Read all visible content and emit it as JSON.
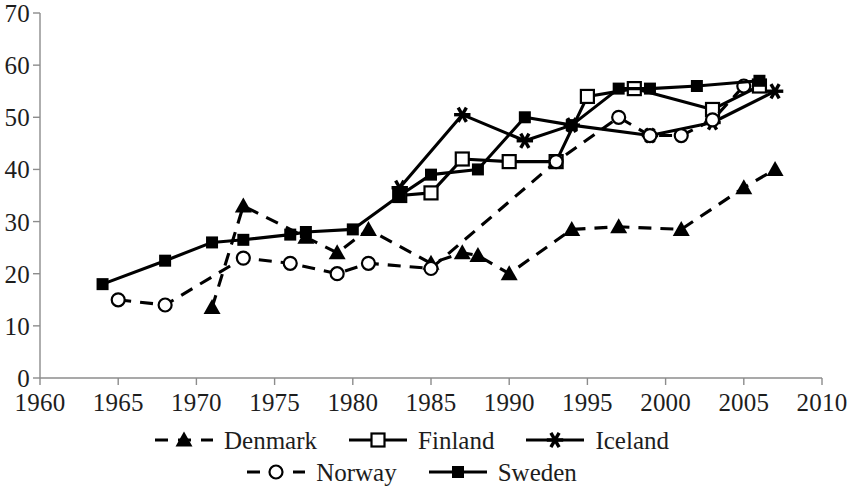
{
  "chart_data": {
    "type": "line",
    "title": "",
    "xlabel": "",
    "ylabel": "",
    "xlim": [
      1960,
      2010
    ],
    "ylim": [
      0,
      70
    ],
    "xticks": [
      1960,
      1965,
      1970,
      1975,
      1980,
      1985,
      1990,
      1995,
      2000,
      2005,
      2010
    ],
    "yticks": [
      0,
      10,
      20,
      30,
      40,
      50,
      60,
      70
    ],
    "grid": false,
    "legend_position": "bottom",
    "series": [
      {
        "name": "Denmark",
        "line_style": "dashed",
        "marker": "filled-triangle",
        "color": "#000000",
        "x": [
          1971,
          1973,
          1977,
          1979,
          1981,
          1985,
          1987,
          1988,
          1990,
          1994,
          1997,
          2001,
          2005,
          2007
        ],
        "y": [
          13.5,
          33,
          27,
          24,
          28.5,
          22,
          24,
          23.5,
          20,
          28.5,
          29,
          28.5,
          36.5,
          40
        ]
      },
      {
        "name": "Finland",
        "line_style": "solid",
        "marker": "open-square",
        "color": "#000000",
        "x": [
          1983,
          1985,
          1987,
          1990,
          1993,
          1995,
          1998,
          2003,
          2006
        ],
        "y": [
          35,
          35.5,
          42,
          41.5,
          41.5,
          54,
          55.5,
          51.5,
          56
        ]
      },
      {
        "name": "Iceland",
        "line_style": "solid",
        "marker": "star",
        "color": "#000000",
        "x": [
          1983,
          1987,
          1991,
          1994,
          1999,
          2003,
          2007
        ],
        "y": [
          36.5,
          50.5,
          45.5,
          48.5,
          46.5,
          49,
          55
        ]
      },
      {
        "name": "Norway",
        "line_style": "dashed",
        "marker": "open-circle",
        "color": "#000000",
        "x": [
          1965,
          1968,
          1973,
          1976,
          1979,
          1981,
          1985,
          1993,
          1997,
          1999,
          2001,
          2003,
          2005
        ],
        "y": [
          15,
          14,
          23,
          22,
          20,
          22,
          21,
          41.5,
          50,
          46.5,
          46.5,
          49.5,
          56
        ]
      },
      {
        "name": "Sweden",
        "line_style": "solid",
        "marker": "filled-square",
        "color": "#000000",
        "x": [
          1964,
          1968,
          1971,
          1973,
          1976,
          1977,
          1980,
          1983,
          1985,
          1988,
          1991,
          1994,
          1997,
          1999,
          2002,
          2006
        ],
        "y": [
          18,
          22.5,
          26,
          26.5,
          27.5,
          28,
          28.5,
          35,
          39,
          40,
          50,
          48.5,
          55.5,
          55.5,
          56,
          57
        ]
      }
    ]
  },
  "legend": {
    "rows": [
      [
        "Denmark",
        "Finland",
        "Iceland"
      ],
      [
        "Norway",
        "Sweden"
      ]
    ]
  },
  "axes": {
    "y_tick_labels": [
      "70",
      "60",
      "50",
      "40",
      "30",
      "20",
      "10",
      "0"
    ],
    "x_tick_labels": [
      "1960",
      "1965",
      "1970",
      "1975",
      "1980",
      "1985",
      "1990",
      "1995",
      "2000",
      "2005",
      "2010"
    ]
  }
}
